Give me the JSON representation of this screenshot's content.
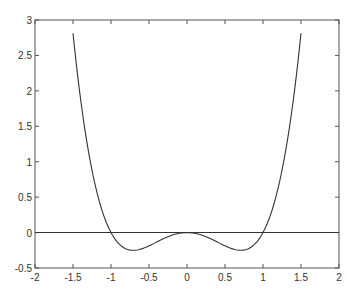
{
  "chart_data": {
    "type": "line",
    "title": "",
    "xlabel": "",
    "ylabel": "",
    "xlim": [
      -2,
      2
    ],
    "ylim": [
      -0.5,
      3
    ],
    "grid": false,
    "legend": null,
    "x_ticks": [
      -2,
      -1.5,
      -1,
      -0.5,
      0,
      0.5,
      1,
      1.5,
      2
    ],
    "x_tick_labels": [
      "-2",
      "-1.5",
      "-1",
      "-0.5",
      "0",
      "0.5",
      "1",
      "1.5",
      "2"
    ],
    "y_ticks": [
      -0.5,
      0,
      0.5,
      1,
      1.5,
      2,
      2.5,
      3
    ],
    "y_tick_labels": [
      "-0.5",
      "0",
      "0.5",
      "1",
      "1.5",
      "2",
      "2.5",
      "3"
    ],
    "series": [
      {
        "name": "curve",
        "description": "y = x^4 - x^2",
        "x": [
          -1.5,
          -1.4,
          -1.3,
          -1.2,
          -1.1,
          -1.0,
          -0.9,
          -0.8,
          -0.707,
          -0.6,
          -0.5,
          -0.4,
          -0.3,
          -0.2,
          -0.1,
          0.0,
          0.1,
          0.2,
          0.3,
          0.4,
          0.5,
          0.6,
          0.707,
          0.8,
          0.9,
          1.0,
          1.1,
          1.2,
          1.3,
          1.4,
          1.5
        ],
        "y": [
          2.8125,
          1.8816,
          1.1661,
          0.6336,
          0.2541,
          0.0,
          -0.1539,
          -0.2304,
          -0.25,
          -0.2304,
          -0.1875,
          -0.1344,
          -0.0819,
          -0.0384,
          -0.0099,
          0.0,
          -0.0099,
          -0.0384,
          -0.0819,
          -0.1344,
          -0.1875,
          -0.2304,
          -0.25,
          -0.2304,
          -0.1539,
          0.0,
          0.2541,
          0.6336,
          1.1661,
          1.8816,
          2.8125
        ],
        "color": "#333333"
      },
      {
        "name": "zero-line",
        "x": [
          -2,
          2
        ],
        "y": [
          0,
          0
        ],
        "color": "#333333"
      }
    ]
  }
}
